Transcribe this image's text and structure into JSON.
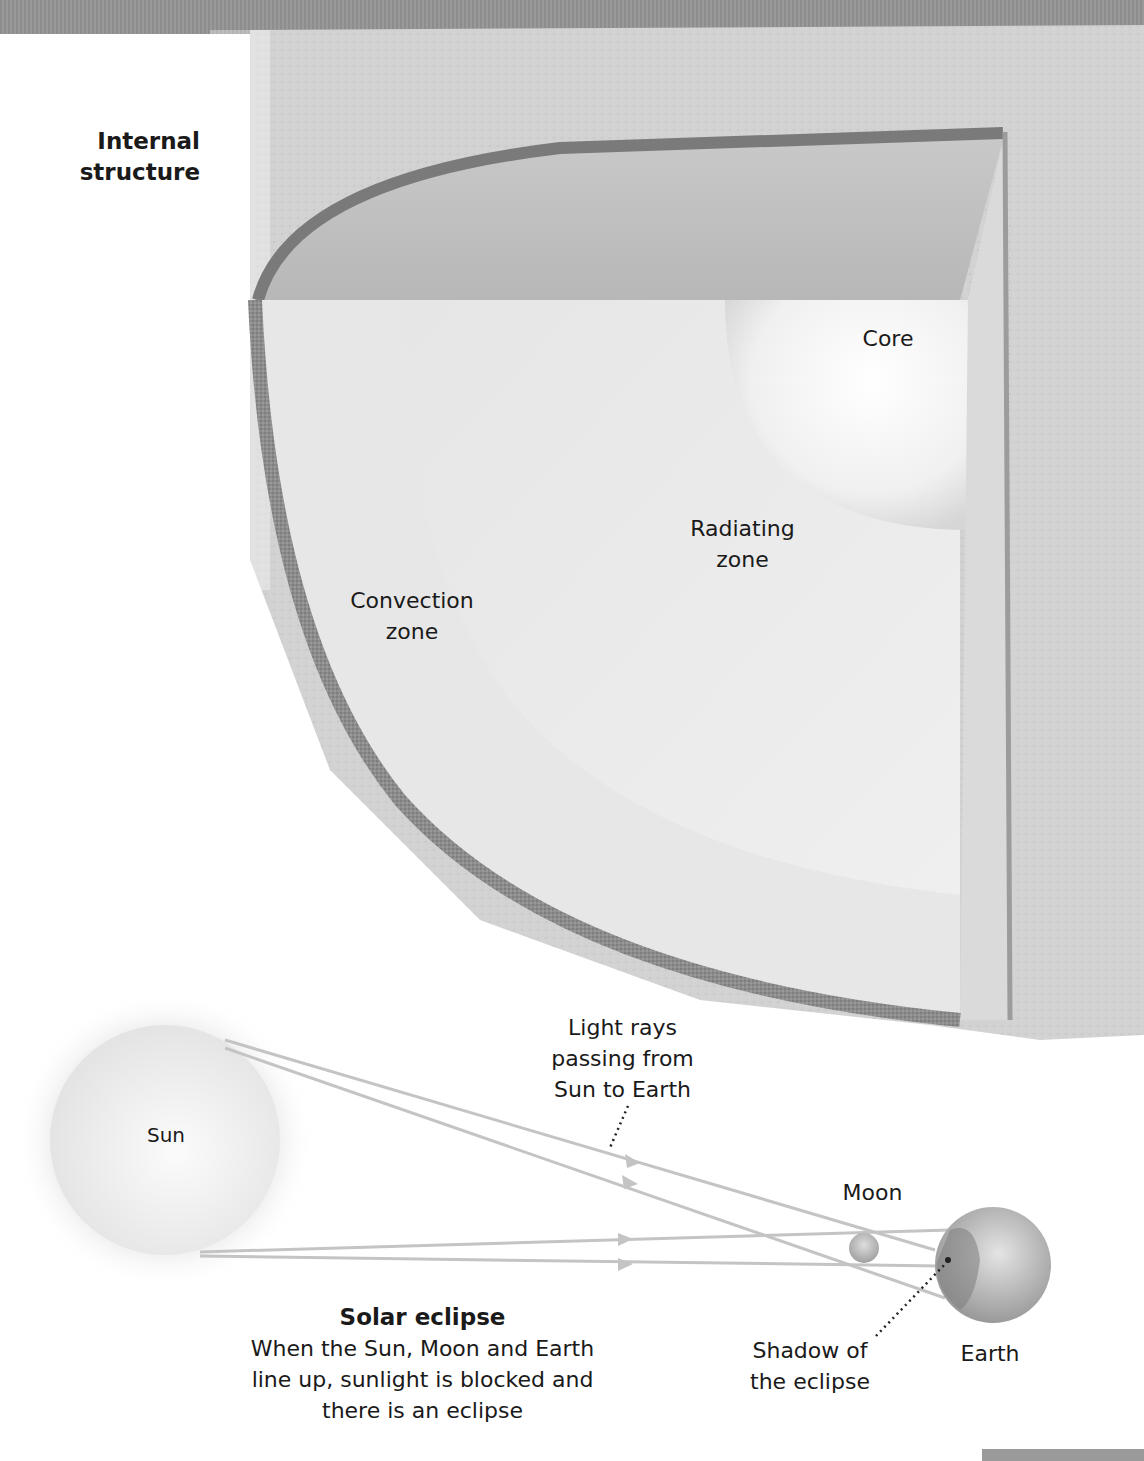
{
  "structure": {
    "title": "Internal\nstructure",
    "title_line1": "Internal",
    "title_line2": "structure",
    "layers": [
      {
        "id": "core",
        "label": "Core"
      },
      {
        "id": "radiating",
        "label_line1": "Radiating",
        "label_line2": "zone"
      },
      {
        "id": "convection",
        "label_line1": "Convection",
        "label_line2": "zone"
      }
    ]
  },
  "eclipse": {
    "sun_label": "Sun",
    "moon_label": "Moon",
    "earth_label": "Earth",
    "rays_label_line1": "Light rays",
    "rays_label_line2": "passing from",
    "rays_label_line3": "Sun to Earth",
    "shadow_label_line1": "Shadow of",
    "shadow_label_line2": "the eclipse",
    "heading": "Solar eclipse",
    "caption_line1": "When the Sun, Moon and Earth",
    "caption_line2": "line up, sunlight is blocked and",
    "caption_line3": "there is an eclipse"
  },
  "colors": {
    "background": "#ffffff",
    "band": "#939393",
    "texture": "#d4d4d4",
    "ray": "#c4c4c4",
    "text": "#1a1a1a"
  }
}
